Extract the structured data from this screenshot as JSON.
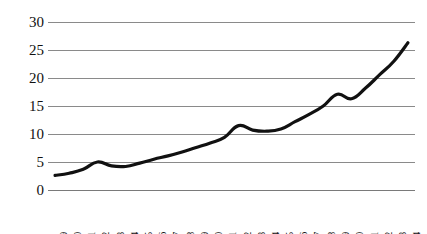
{
  "chart_data": {
    "type": "line",
    "title": "",
    "subtitle": "",
    "xlabel": "",
    "ylabel": "",
    "ylim": [
      0,
      30
    ],
    "yticks": [
      0,
      5,
      10,
      15,
      20,
      25,
      30
    ],
    "ytick_labels": [
      "0",
      "5",
      "10",
      "15",
      "20",
      "25",
      "30"
    ],
    "grid": "horizontal",
    "legend": "none",
    "background": "#ffffff",
    "line_color": "#111111",
    "line_width": 3.2,
    "markers": "none",
    "categories": [
      "1989",
      "1990",
      "1991",
      "1992",
      "1993",
      "1994",
      "1995",
      "1996",
      "1997",
      "1998",
      "1999",
      "2000",
      "2001",
      "2002",
      "2003",
      "2004",
      "2005",
      "2006",
      "2007",
      "2008",
      "2009",
      "2010",
      "2011",
      "2012",
      "2013",
      "2014"
    ],
    "values": [
      2.6,
      3.0,
      3.7,
      5.0,
      4.3,
      4.2,
      4.8,
      5.5,
      6.1,
      6.8,
      7.6,
      8.4,
      9.4,
      11.5,
      10.7,
      10.5,
      10.9,
      12.2,
      13.5,
      15.0,
      17.1,
      16.3,
      18.2,
      20.6,
      23.0,
      26.3
    ]
  }
}
